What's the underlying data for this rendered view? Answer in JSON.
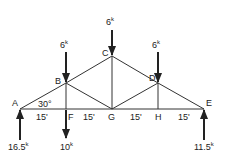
{
  "diagram": {
    "type": "truss",
    "nodes": [
      {
        "id": "A",
        "x": 20,
        "y": 109,
        "label": "A",
        "lx": 12,
        "ly": 106
      },
      {
        "id": "B",
        "x": 66,
        "y": 83,
        "label": "B",
        "lx": 55,
        "ly": 84
      },
      {
        "id": "C",
        "x": 112,
        "y": 56,
        "label": "C",
        "lx": 102,
        "ly": 56
      },
      {
        "id": "D",
        "x": 158,
        "y": 83,
        "label": "D",
        "lx": 149,
        "ly": 81
      },
      {
        "id": "E",
        "x": 204,
        "y": 109,
        "label": "E",
        "lx": 206,
        "ly": 106
      },
      {
        "id": "F",
        "x": 66,
        "y": 109,
        "label": "F",
        "lx": 68,
        "ly": 120
      },
      {
        "id": "G",
        "x": 112,
        "y": 109,
        "label": "G",
        "lx": 108,
        "ly": 120
      },
      {
        "id": "H",
        "x": 158,
        "y": 109,
        "label": "H",
        "lx": 155,
        "ly": 120
      }
    ],
    "members": [
      [
        "A",
        "B"
      ],
      [
        "B",
        "C"
      ],
      [
        "C",
        "D"
      ],
      [
        "D",
        "E"
      ],
      [
        "A",
        "F"
      ],
      [
        "F",
        "G"
      ],
      [
        "G",
        "H"
      ],
      [
        "H",
        "E"
      ],
      [
        "B",
        "F"
      ],
      [
        "B",
        "G"
      ],
      [
        "C",
        "G"
      ],
      [
        "D",
        "G"
      ],
      [
        "D",
        "H"
      ]
    ],
    "angle_label": {
      "text": "30°",
      "x": 38,
      "y": 107
    },
    "spans": [
      {
        "text": "15'",
        "x": 36,
        "y": 120
      },
      {
        "text": "15'",
        "x": 83,
        "y": 120
      },
      {
        "text": "15'",
        "x": 130,
        "y": 120
      },
      {
        "text": "15'",
        "x": 178,
        "y": 120
      }
    ],
    "loads": [
      {
        "node": "B",
        "value": "6",
        "unit": "k",
        "x1": 66,
        "y1": 52,
        "x2": 66,
        "y2": 82,
        "dir": "down",
        "lx": 60,
        "ly": 48
      },
      {
        "node": "C",
        "value": "6",
        "unit": "k",
        "x1": 112,
        "y1": 30,
        "x2": 112,
        "y2": 55,
        "dir": "down",
        "lx": 106,
        "ly": 25
      },
      {
        "node": "D",
        "value": "6",
        "unit": "k",
        "x1": 158,
        "y1": 52,
        "x2": 158,
        "y2": 82,
        "dir": "down",
        "lx": 152,
        "ly": 48
      },
      {
        "node": "F",
        "value": "10",
        "unit": "k",
        "x1": 66,
        "y1": 110,
        "x2": 66,
        "y2": 138,
        "dir": "down",
        "lx": 60,
        "ly": 150
      }
    ],
    "reactions": [
      {
        "node": "A",
        "value": "16.5",
        "unit": "k",
        "x1": 20,
        "y1": 140,
        "x2": 20,
        "y2": 110,
        "dir": "up",
        "lx": 8,
        "ly": 150
      },
      {
        "node": "E",
        "value": "11.5",
        "unit": "k",
        "x1": 204,
        "y1": 140,
        "x2": 204,
        "y2": 110,
        "dir": "up",
        "lx": 194,
        "ly": 150
      }
    ]
  }
}
